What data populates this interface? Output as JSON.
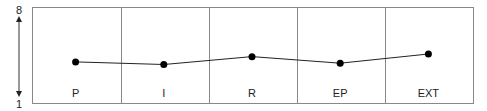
{
  "chart_data": {
    "type": "line",
    "title": "",
    "categories": [
      "P",
      "I",
      "R",
      "EP",
      "EXT"
    ],
    "series": [
      {
        "name": "score",
        "values": [
          3.9,
          3.7,
          4.3,
          3.8,
          4.5
        ]
      }
    ],
    "ylim": [
      1,
      8
    ],
    "y_ticks": [
      "8",
      "1"
    ],
    "xlabel": "",
    "ylabel": "",
    "grid": false
  },
  "axis": {
    "top": "8",
    "bottom": "1"
  },
  "colors": {
    "line": "#222222",
    "border": "#888888",
    "point": "#000000"
  }
}
